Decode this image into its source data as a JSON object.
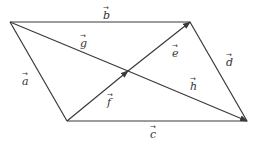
{
  "diagram": {
    "type": "parallelogram-vectors",
    "vertices": {
      "top_left": [
        10,
        22
      ],
      "top_right": [
        190,
        22
      ],
      "bottom_left": [
        67,
        121
      ],
      "bottom_right": [
        247,
        121
      ],
      "center": [
        128,
        71
      ]
    },
    "vectors": [
      {
        "name": "b",
        "label": "b",
        "arrow": "→",
        "label_pos": [
          103,
          16
        ]
      },
      {
        "name": "a",
        "label": "a",
        "arrow": "→",
        "label_pos": [
          24,
          83
        ]
      },
      {
        "name": "c",
        "label": "c",
        "arrow": "→",
        "label_pos": [
          152,
          136
        ]
      },
      {
        "name": "d",
        "label": "d",
        "arrow": "→",
        "label_pos": [
          227,
          62
        ]
      },
      {
        "name": "g",
        "label": "g",
        "arrow": "→",
        "label_pos": [
          82,
          46
        ]
      },
      {
        "name": "h",
        "label": "h",
        "arrow": "→",
        "label_pos": [
          192,
          90
        ]
      },
      {
        "name": "e",
        "label": "e",
        "arrow": "→",
        "label_pos": [
          175,
          55
        ]
      },
      {
        "name": "f",
        "label": "f",
        "arrow": "→",
        "label_pos": [
          109,
          104
        ]
      }
    ],
    "stroke_color": "#3a3a3a",
    "background": "#ffffff"
  }
}
